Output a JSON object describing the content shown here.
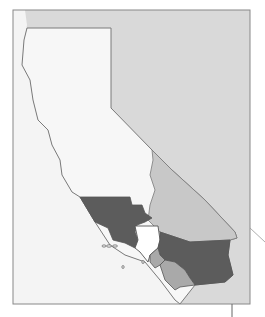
{
  "map": {
    "subject": "California counties map",
    "colors": {
      "frame_border": "#888888",
      "background_ocean": "#f4f4f4",
      "outside_state": "#d9d9d9",
      "state_fill": "#f7f7f7",
      "county_dark": "#5c5c5c",
      "county_medium": "#a9a9a9",
      "county_light": "#c8c8c8",
      "county_white": "#ffffff",
      "border_line": "#7a7a7a"
    },
    "regions": [
      {
        "name": "ventura-santa-barbara-area",
        "shade": "dark"
      },
      {
        "name": "los-angeles-area",
        "shade": "white"
      },
      {
        "name": "san-bernardino-inyo-area",
        "shade": "light"
      },
      {
        "name": "riverside-area",
        "shade": "dark"
      },
      {
        "name": "orange-area",
        "shade": "medium"
      },
      {
        "name": "san-diego-area",
        "shade": "medium"
      }
    ]
  }
}
